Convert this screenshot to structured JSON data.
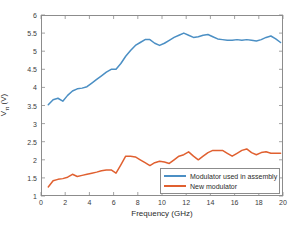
{
  "chart_data": {
    "type": "line",
    "title": "",
    "xlabel": "Frequency (GHz)",
    "ylabel": "V_π (V)",
    "ylabel_base": "V",
    "ylabel_sub": "π",
    "ylabel_unit": " (V)",
    "xlim": [
      0,
      20
    ],
    "ylim": [
      1,
      6
    ],
    "xticks": [
      0,
      2,
      4,
      6,
      8,
      10,
      12,
      14,
      16,
      18,
      20
    ],
    "xtick_labels": [
      "0",
      "2",
      "4",
      "6",
      "8",
      "10",
      "12",
      "14",
      "16",
      "18",
      "20"
    ],
    "yticks": [
      1,
      1.5,
      2,
      2.5,
      3,
      3.5,
      4,
      4.5,
      5,
      5.5,
      6
    ],
    "ytick_labels": [
      "1",
      "1.5",
      "2",
      "2.5",
      "3",
      "3.5",
      "4",
      "4.5",
      "5",
      "5.5",
      "6"
    ],
    "grid": false,
    "legend_position": "lower right",
    "series": [
      {
        "name": "Modulator used in assembly",
        "color": "#4b8fc4",
        "x": [
          0.6,
          1.0,
          1.4,
          1.8,
          2.2,
          2.6,
          3.0,
          3.4,
          3.8,
          4.2,
          4.6,
          5.0,
          5.4,
          5.8,
          6.2,
          6.6,
          7.0,
          7.4,
          7.8,
          8.2,
          8.6,
          9.0,
          9.4,
          9.8,
          10.2,
          10.6,
          11.0,
          11.4,
          11.8,
          12.2,
          12.6,
          13.0,
          13.4,
          13.8,
          14.2,
          14.6,
          15.0,
          15.4,
          15.8,
          16.2,
          16.6,
          17.0,
          17.4,
          17.8,
          18.2,
          18.6,
          19.0,
          19.4,
          19.8
        ],
        "y": [
          3.52,
          3.66,
          3.7,
          3.62,
          3.78,
          3.9,
          3.96,
          3.98,
          4.02,
          4.12,
          4.22,
          4.32,
          4.42,
          4.5,
          4.5,
          4.66,
          4.86,
          5.02,
          5.16,
          5.24,
          5.32,
          5.32,
          5.22,
          5.16,
          5.22,
          5.3,
          5.38,
          5.44,
          5.5,
          5.44,
          5.38,
          5.4,
          5.44,
          5.46,
          5.4,
          5.34,
          5.32,
          5.3,
          5.3,
          5.32,
          5.3,
          5.32,
          5.3,
          5.28,
          5.32,
          5.38,
          5.42,
          5.34,
          5.24
        ]
      },
      {
        "name": "New modulator",
        "color": "#e06030",
        "x": [
          0.6,
          1.0,
          1.4,
          1.8,
          2.2,
          2.6,
          3.0,
          3.4,
          3.8,
          4.2,
          4.6,
          5.0,
          5.4,
          5.8,
          6.2,
          6.6,
          7.0,
          7.4,
          7.8,
          8.2,
          8.6,
          9.0,
          9.4,
          9.8,
          10.2,
          10.6,
          11.0,
          11.4,
          11.8,
          12.2,
          12.6,
          13.0,
          13.4,
          13.8,
          14.2,
          14.6,
          15.0,
          15.4,
          15.8,
          16.2,
          16.6,
          17.0,
          17.4,
          17.8,
          18.2,
          18.6,
          19.0,
          19.4,
          19.8
        ],
        "y": [
          1.25,
          1.42,
          1.46,
          1.48,
          1.52,
          1.6,
          1.54,
          1.57,
          1.6,
          1.63,
          1.66,
          1.7,
          1.72,
          1.72,
          1.63,
          1.86,
          2.1,
          2.1,
          2.08,
          2.0,
          1.92,
          1.84,
          1.92,
          1.96,
          1.94,
          1.9,
          2.0,
          2.1,
          2.14,
          2.22,
          2.1,
          2.0,
          2.1,
          2.2,
          2.26,
          2.26,
          2.26,
          2.18,
          2.1,
          2.18,
          2.26,
          2.3,
          2.2,
          2.14,
          2.2,
          2.22,
          2.18,
          2.18,
          2.18
        ]
      }
    ]
  },
  "legend": {
    "items": [
      {
        "label": "Modulator used in assembly",
        "color": "#4b8fc4"
      },
      {
        "label": "New modulator",
        "color": "#e06030"
      }
    ]
  }
}
